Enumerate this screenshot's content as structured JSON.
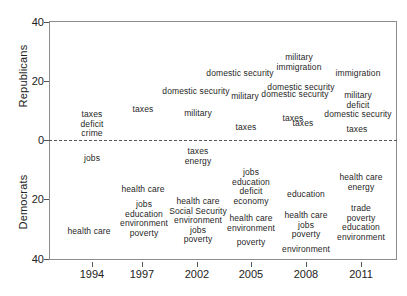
{
  "chart_data": {
    "type": "scatter",
    "title": "",
    "subtitle": "",
    "xlabel": "",
    "ylabel": "",
    "grid": false,
    "legend": null,
    "x": [
      1994,
      1997,
      2002,
      2005,
      2008,
      2011
    ],
    "x_tick_labels": [
      "1994",
      "1997",
      "2002",
      "2005",
      "2008",
      "2011"
    ],
    "xlim": [
      1992.5,
      2013.0
    ],
    "ylim": [
      -40,
      40
    ],
    "y_axis_groups": [
      {
        "name": "Republicans",
        "label": "Republicans",
        "direction": "up",
        "ticks": [
          0,
          20,
          40
        ],
        "tick_labels": [
          "0",
          "20",
          "40"
        ]
      },
      {
        "name": "Democrats",
        "label": "Democrats",
        "direction": "down",
        "ticks": [
          20,
          40
        ],
        "tick_labels": [
          "20",
          "40"
        ]
      }
    ],
    "y_tick_labels_top_to_bottom": [
      "40",
      "20",
      "0",
      "20",
      "40"
    ],
    "annotations": [
      {
        "group": "Republicans",
        "year": 1994,
        "value": 5,
        "text": "taxes\ndeficit\ncrime",
        "lines": [
          "taxes",
          "deficit",
          "crime"
        ]
      },
      {
        "group": "Republicans",
        "year": 1997,
        "value": 10,
        "text": "taxes",
        "lines": [
          "taxes"
        ]
      },
      {
        "group": "Republicans",
        "year": 2000,
        "value": 14,
        "text": "domestic security",
        "lines": [
          "domestic security"
        ]
      },
      {
        "group": "Republicans",
        "year": 2001,
        "value": 10,
        "text": "military",
        "lines": [
          "military"
        ]
      },
      {
        "group": "Republicans",
        "year": 2002,
        "value": 16,
        "text": "domestic security",
        "lines": [
          "domestic security"
        ]
      },
      {
        "group": "Republicans",
        "year": 2003,
        "value": 10,
        "text": "military",
        "lines": [
          "military"
        ]
      },
      {
        "group": "Republicans",
        "year": 2004,
        "value": 4,
        "text": "taxes",
        "lines": [
          "taxes"
        ]
      },
      {
        "group": "Republicans",
        "year": 2005,
        "value": 27,
        "text": "military\nimmigration",
        "lines": [
          "military",
          "immigration"
        ]
      },
      {
        "group": "Republicans",
        "year": 2006,
        "value": 15,
        "text": "domestic security",
        "lines": [
          "domestic security"
        ]
      },
      {
        "group": "Republicans",
        "year": 2007,
        "value": 7,
        "text": "taxes",
        "lines": [
          "taxes"
        ]
      },
      {
        "group": "Republicans",
        "year": 2008,
        "value": 19,
        "text": "domestic security",
        "lines": [
          "domestic security"
        ]
      },
      {
        "group": "Republicans",
        "year": 2009,
        "value": 5,
        "text": "taxes",
        "lines": [
          "taxes"
        ]
      },
      {
        "group": "Republicans",
        "year": 2011,
        "value": 23,
        "text": "immigration",
        "lines": [
          "immigration"
        ]
      },
      {
        "group": "Republicans",
        "year": 2011,
        "value": 14,
        "text": "military\ndeficit\ndomestic security",
        "lines": [
          "military",
          "deficit",
          "domestic security"
        ]
      },
      {
        "group": "Republicans",
        "year": 2011,
        "value": 3,
        "text": "taxes",
        "lines": [
          "taxes"
        ]
      },
      {
        "group": "Democrats",
        "year": 1994,
        "value": 6,
        "text": "jobs",
        "lines": [
          "jobs"
        ]
      },
      {
        "group": "Democrats",
        "year": 1994,
        "value": 30,
        "text": "health care",
        "lines": [
          "health care"
        ]
      },
      {
        "group": "Democrats",
        "year": 1997,
        "value": 14,
        "text": "health care",
        "lines": [
          "health care"
        ]
      },
      {
        "group": "Democrats",
        "year": 1997,
        "value": 23,
        "text": "jobs\neducation\nenvironment\npoverty",
        "lines": [
          "jobs",
          "education",
          "environment",
          "poverty"
        ]
      },
      {
        "group": "Democrats",
        "year": 2002,
        "value": 5,
        "text": "taxes\nenergy",
        "lines": [
          "taxes",
          "energy"
        ]
      },
      {
        "group": "Democrats",
        "year": 2002,
        "value": 25,
        "text": "health care\nSocial Security\nenvironment\njobs\npoverty",
        "lines": [
          "health care",
          "Social Security",
          "environment",
          "jobs",
          "poverty"
        ]
      },
      {
        "group": "Democrats",
        "year": 2005,
        "value": 14,
        "text": "jobs\neducation\ndeficit\neconomy",
        "lines": [
          "jobs",
          "education",
          "deficit",
          "economy"
        ]
      },
      {
        "group": "Democrats",
        "year": 2005,
        "value": 26,
        "text": "health care\nenvironment",
        "lines": [
          "health care",
          "environment"
        ]
      },
      {
        "group": "Democrats",
        "year": 2005,
        "value": 32,
        "text": "poverty",
        "lines": [
          "poverty"
        ]
      },
      {
        "group": "Democrats",
        "year": 2008,
        "value": 19,
        "text": "education",
        "lines": [
          "education"
        ]
      },
      {
        "group": "Democrats",
        "year": 2008,
        "value": 27,
        "text": "health care\njobs\npoverty",
        "lines": [
          "health care",
          "jobs",
          "poverty"
        ]
      },
      {
        "group": "Democrats",
        "year": 2008,
        "value": 35,
        "text": "environment",
        "lines": [
          "environment"
        ]
      },
      {
        "group": "Democrats",
        "year": 2011,
        "value": 12,
        "text": "health care\nenergy",
        "lines": [
          "health care",
          "energy"
        ]
      },
      {
        "group": "Democrats",
        "year": 2011,
        "value": 24,
        "text": "trade\npoverty\neducation\nenvironment",
        "lines": [
          "trade",
          "poverty",
          "education",
          "environment"
        ]
      }
    ],
    "colors": {
      "text": "#1f1f1f",
      "axis": "#8c8c8c",
      "zero_line": "#555555",
      "background": "#ffffff"
    }
  },
  "layout": {
    "plot": {
      "left": 49,
      "top": 21,
      "width": 348,
      "height": 239
    },
    "zero_y": 140,
    "px_per_unit": 2.95,
    "yticks": [
      {
        "label": "40",
        "y": 22
      },
      {
        "label": "20",
        "y": 81
      },
      {
        "label": "0",
        "y": 140
      },
      {
        "label": "20",
        "y": 199
      },
      {
        "label": "40",
        "y": 259
      }
    ],
    "xticks": [
      {
        "label": "1994",
        "x": 92
      },
      {
        "label": "1997",
        "x": 142
      },
      {
        "label": "2002",
        "x": 197
      },
      {
        "label": "2005",
        "x": 251
      },
      {
        "label": "2008",
        "x": 306
      },
      {
        "label": "2011",
        "x": 361
      }
    ],
    "words": [
      {
        "id": "rep-1994-a",
        "x": 92,
        "y": 124,
        "key": 0
      },
      {
        "id": "rep-1997-a",
        "x": 143,
        "y": 110,
        "key": 1
      },
      {
        "id": "rep-2000-a",
        "x": 196,
        "y": 92,
        "key": 2
      },
      {
        "id": "rep-2001-a",
        "x": 198,
        "y": 114,
        "key": 3
      },
      {
        "id": "rep-2002-a",
        "x": 240,
        "y": 74,
        "key": 4
      },
      {
        "id": "rep-2003-a",
        "x": 245,
        "y": 97,
        "key": 5
      },
      {
        "id": "rep-2004-a",
        "x": 246,
        "y": 128,
        "key": 6
      },
      {
        "id": "rep-2005-a",
        "x": 299,
        "y": 63,
        "key": 7
      },
      {
        "id": "rep-2006-a",
        "x": 295,
        "y": 95,
        "key": 8
      },
      {
        "id": "rep-2007-a",
        "x": 293,
        "y": 119,
        "key": 9
      },
      {
        "id": "rep-2008-a",
        "x": 301,
        "y": 88,
        "key": 10
      },
      {
        "id": "rep-2009-a",
        "x": 303,
        "y": 124,
        "key": 11
      },
      {
        "id": "rep-2011-a",
        "x": 358,
        "y": 74,
        "key": 12
      },
      {
        "id": "rep-2011-b",
        "x": 358,
        "y": 105,
        "key": 13
      },
      {
        "id": "rep-2011-c",
        "x": 357,
        "y": 130,
        "key": 14
      },
      {
        "id": "dem-1994-a",
        "x": 92,
        "y": 159,
        "key": 15
      },
      {
        "id": "dem-1994-b",
        "x": 89,
        "y": 232,
        "key": 16
      },
      {
        "id": "dem-1997-a",
        "x": 143,
        "y": 190,
        "key": 17
      },
      {
        "id": "dem-1997-b",
        "x": 144,
        "y": 219,
        "key": 18
      },
      {
        "id": "dem-2002-a",
        "x": 198,
        "y": 157,
        "key": 19
      },
      {
        "id": "dem-2002-b",
        "x": 198,
        "y": 221,
        "key": 20
      },
      {
        "id": "dem-2005-a",
        "x": 251,
        "y": 187,
        "key": 21
      },
      {
        "id": "dem-2005-b",
        "x": 251,
        "y": 224,
        "key": 22
      },
      {
        "id": "dem-2005-c",
        "x": 251,
        "y": 243,
        "key": 23
      },
      {
        "id": "dem-2008-a",
        "x": 306,
        "y": 195,
        "key": 24
      },
      {
        "id": "dem-2008-b",
        "x": 306,
        "y": 225,
        "key": 25
      },
      {
        "id": "dem-2008-c",
        "x": 306,
        "y": 250,
        "key": 26
      },
      {
        "id": "dem-2011-a",
        "x": 361,
        "y": 183,
        "key": 27
      },
      {
        "id": "dem-2011-b",
        "x": 361,
        "y": 223,
        "key": 28
      }
    ]
  },
  "axis": {
    "republicans_label": "Republicans",
    "democrats_label": "Democrats"
  }
}
